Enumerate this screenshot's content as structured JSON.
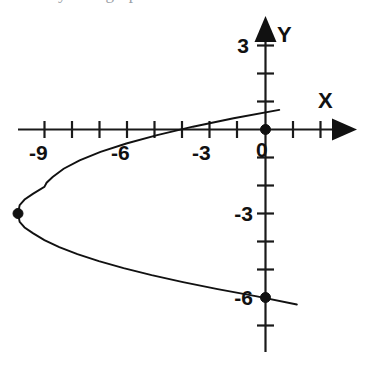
{
  "figure": {
    "type": "graph",
    "background_color": "#ffffff",
    "ink_color": "#111111",
    "partial_top_text": "y = ... graph",
    "axis_labels": {
      "x": "X",
      "y": "Y"
    },
    "x_tick_labels": [
      {
        "value": -9,
        "text": "-9"
      },
      {
        "value": -6,
        "text": "-6"
      },
      {
        "value": -3,
        "text": "-3"
      },
      {
        "value": 0,
        "text": "0"
      }
    ],
    "y_tick_labels": [
      {
        "value": 3,
        "text": "3"
      },
      {
        "value": -3,
        "text": "-3"
      },
      {
        "value": -6,
        "text": "-6"
      }
    ],
    "marked_points": [
      {
        "label": "vertex",
        "x": -9,
        "y": -3
      },
      {
        "label": "y-intercept-upper",
        "x": 0,
        "y": 0
      },
      {
        "label": "y-intercept-lower",
        "x": 0,
        "y": -6
      }
    ]
  },
  "chart_data": {
    "type": "line",
    "title": "",
    "subtitle": "",
    "xlabel": "X",
    "ylabel": "Y",
    "xlim": [
      -10,
      2.5
    ],
    "ylim": [
      -8,
      3.5
    ],
    "grid": false,
    "legend": null,
    "x_ticks": [
      -10,
      -9,
      -8,
      -7,
      -6,
      -5,
      -4,
      -3,
      -2,
      -1,
      0,
      1,
      2
    ],
    "x_tick_labels_shown": [
      "-9",
      "-6",
      "-3",
      "0"
    ],
    "y_ticks": [
      3,
      2,
      1,
      0,
      -1,
      -2,
      -3,
      -4,
      -5,
      -6,
      -7
    ],
    "y_tick_labels_shown": [
      "3",
      "-3",
      "-6"
    ],
    "equation": "x = (y + 3)^2 - 9",
    "orientation": "opens-right (sideways parabola)",
    "vertex": [
      -9,
      -3
    ],
    "annotations": [
      {
        "text": "-9",
        "x": -9,
        "y": -0.65
      },
      {
        "text": "-6",
        "x": -6,
        "y": -0.65
      },
      {
        "text": "-3",
        "x": -3,
        "y": -0.65
      },
      {
        "text": "0",
        "x": 0.15,
        "y": -0.65
      },
      {
        "text": "3",
        "x": -0.7,
        "y": 3
      },
      {
        "text": "-3",
        "x": -1.0,
        "y": -3
      },
      {
        "text": "-6",
        "x": -1.0,
        "y": -6
      },
      {
        "text": "X",
        "x": 2.1,
        "y": 1.0
      },
      {
        "text": "Y",
        "x": 0.5,
        "y": 3.6
      }
    ],
    "series": [
      {
        "name": "x = (y+3)^2 - 9",
        "x": [
          0.5,
          -1.16,
          -2.64,
          -3.94,
          -5.06,
          -6.0,
          -6.76,
          -7.34,
          -7.74,
          -7.96,
          -8.04,
          -8.46,
          -8.76,
          -8.94,
          -9.0,
          -8.94,
          -8.76,
          -8.46,
          -8.04,
          -7.5,
          -6.84,
          -6.06,
          -5.16,
          -4.14,
          -3.0,
          -1.74,
          -0.36,
          1.14
        ],
        "y": [
          0.7,
          0.4,
          0.1,
          -0.2,
          -0.5,
          -0.8,
          -1.1,
          -1.4,
          -1.7,
          -1.9,
          -2.05,
          -2.3,
          -2.5,
          -2.7,
          -3.0,
          -3.3,
          -3.5,
          -3.7,
          -3.95,
          -4.2,
          -4.45,
          -4.7,
          -4.95,
          -5.2,
          -5.45,
          -5.7,
          -5.95,
          -6.25
        ]
      }
    ],
    "points": [
      {
        "x": -9,
        "y": -3
      },
      {
        "x": 0,
        "y": 0
      },
      {
        "x": 0,
        "y": -6
      }
    ]
  }
}
